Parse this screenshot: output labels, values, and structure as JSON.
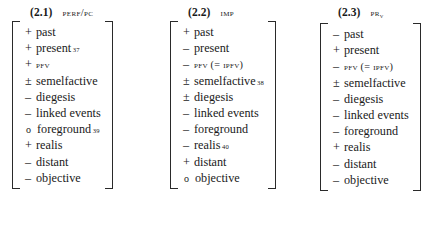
{
  "figure": {
    "caption_note": "",
    "blocks": [
      {
        "number": "(2.1)",
        "label_main": "perf",
        "label_sep": "/",
        "label_sub": "pc",
        "features": [
          {
            "sign": "+",
            "name": "past",
            "footnote": ""
          },
          {
            "sign": "+",
            "name": "present",
            "footnote": "37"
          },
          {
            "sign": "+",
            "name": "PFV",
            "smallcaps": true,
            "footnote": ""
          },
          {
            "sign": "±",
            "name": "semelfactive",
            "footnote": ""
          },
          {
            "sign": "–",
            "name": "diegesis",
            "footnote": ""
          },
          {
            "sign": "–",
            "name": "linked events",
            "footnote": ""
          },
          {
            "sign": "o",
            "name": "foreground",
            "footnote": "39"
          },
          {
            "sign": "+",
            "name": "realis",
            "footnote": ""
          },
          {
            "sign": "–",
            "name": "distant",
            "footnote": ""
          },
          {
            "sign": "–",
            "name": "objective",
            "footnote": ""
          }
        ]
      },
      {
        "number": "(2.2)",
        "label_main": "imp",
        "label_sep": "",
        "label_sub": "",
        "features": [
          {
            "sign": "+",
            "name": "past",
            "footnote": ""
          },
          {
            "sign": "–",
            "name": "present",
            "footnote": ""
          },
          {
            "sign": "–",
            "name": "PFV (= IPFV)",
            "smallcaps": true,
            "footnote": ""
          },
          {
            "sign": "±",
            "name": "semelfactive",
            "footnote": "38"
          },
          {
            "sign": "±",
            "name": "diegesis",
            "footnote": ""
          },
          {
            "sign": "–",
            "name": "linked events",
            "footnote": ""
          },
          {
            "sign": "–",
            "name": "foreground",
            "footnote": ""
          },
          {
            "sign": "–",
            "name": "realis",
            "footnote": "40"
          },
          {
            "sign": "+",
            "name": "distant",
            "footnote": ""
          },
          {
            "sign": "o",
            "name": "objective",
            "footnote": ""
          }
        ]
      },
      {
        "number": "(2.3)",
        "label_main": "pr",
        "label_sep": "",
        "label_sub": "v",
        "features": [
          {
            "sign": "–",
            "name": "past",
            "footnote": ""
          },
          {
            "sign": "+",
            "name": "present",
            "footnote": ""
          },
          {
            "sign": "–",
            "name": "PFV (= IPFV)",
            "smallcaps": true,
            "footnote": ""
          },
          {
            "sign": "±",
            "name": "semelfactive",
            "footnote": ""
          },
          {
            "sign": "–",
            "name": "diegesis",
            "footnote": ""
          },
          {
            "sign": "–",
            "name": "linked events",
            "footnote": ""
          },
          {
            "sign": "–",
            "name": "foreground",
            "footnote": ""
          },
          {
            "sign": "+",
            "name": "realis",
            "footnote": ""
          },
          {
            "sign": "–",
            "name": "distant",
            "footnote": ""
          },
          {
            "sign": "–",
            "name": "objective",
            "footnote": ""
          }
        ]
      }
    ]
  }
}
